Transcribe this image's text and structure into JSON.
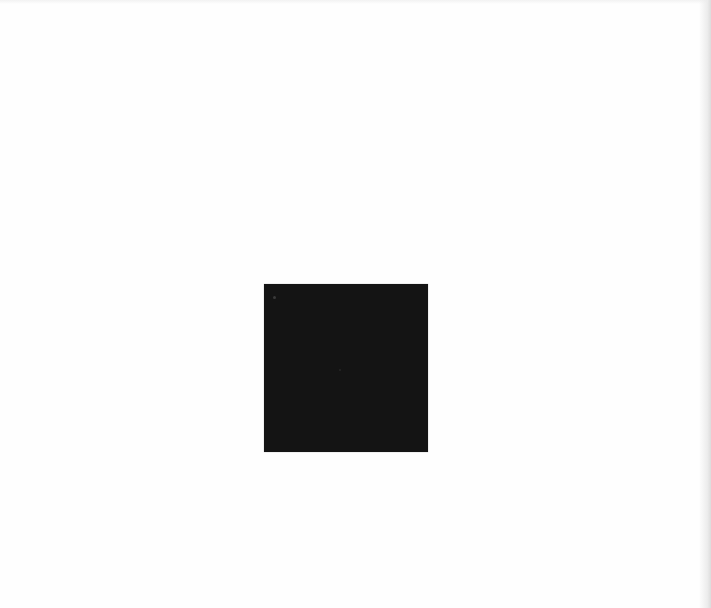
{
  "page": {
    "background_color": "#fefefe",
    "text_content": []
  },
  "figure": {
    "shape": "square",
    "fill_color": "#141414",
    "label": ""
  }
}
